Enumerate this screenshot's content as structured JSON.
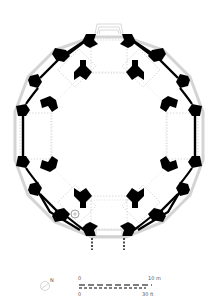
{
  "diagram": {
    "type": "architectural-floor-plan",
    "shape": "octagonal centralized building",
    "colors": {
      "wall": "#000000",
      "guide": "#c8c8c8",
      "background": "#ffffff",
      "text": "#555555"
    }
  },
  "scale_bar": {
    "metric_start": "0",
    "metric_end": "10 m",
    "imperial_start": "0",
    "imperial_end": "30 ft"
  },
  "north_arrow": {
    "label": "N",
    "icon": "north-arrow-icon"
  },
  "features": {
    "inner_piers": 8,
    "outer_bays": 8,
    "entrance": "south",
    "stair": "southwest"
  }
}
